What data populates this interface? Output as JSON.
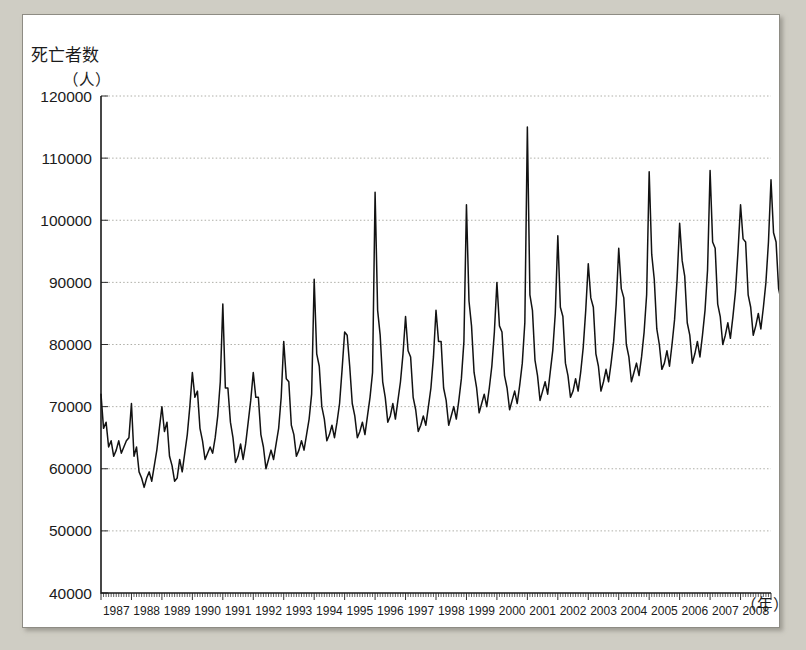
{
  "figure": {
    "y_axis_title": "死亡者数",
    "y_axis_unit": "（人）",
    "x_axis_unit": "（年）"
  },
  "chart_data": {
    "type": "line",
    "title": "",
    "subtitle": "",
    "xlabel": "（年）",
    "ylabel": "死亡者数（人）",
    "ylim": [
      40000,
      120000
    ],
    "xlim": [
      1987,
      2009
    ],
    "grid": true,
    "legend": null,
    "y_ticks": [
      40000,
      50000,
      60000,
      70000,
      80000,
      90000,
      100000,
      110000,
      120000
    ],
    "y_tick_labels": [
      "40000",
      "50000",
      "60000",
      "70000",
      "80000",
      "90000",
      "100000",
      "110000",
      "120000"
    ],
    "x_ticks": [
      1987,
      1988,
      1989,
      1990,
      1991,
      1992,
      1993,
      1994,
      1995,
      1996,
      1997,
      1998,
      1999,
      2000,
      2001,
      2002,
      2003,
      2004,
      2005,
      2006,
      2007,
      2008
    ],
    "x_tick_labels": [
      "1987",
      "1988",
      "1989",
      "1990",
      "1991",
      "1992",
      "1993",
      "1994",
      "1995",
      "1996",
      "1997",
      "1998",
      "1999",
      "2000",
      "2001",
      "2002",
      "2003",
      "2004",
      "2005",
      "2006",
      "2007",
      "2008"
    ],
    "x_minor_tick_interval_months": 1,
    "series": [
      {
        "name": "monthly deaths",
        "x_start": "1987-01",
        "x_step": "1 month",
        "values": [
          72000,
          66500,
          67500,
          63500,
          64500,
          62000,
          63000,
          64500,
          62500,
          63500,
          64500,
          65000,
          70500,
          62000,
          63500,
          59500,
          58500,
          57000,
          58500,
          59500,
          58000,
          60500,
          63000,
          66500,
          70000,
          66000,
          67500,
          62000,
          60500,
          58000,
          58500,
          61500,
          59500,
          62500,
          65500,
          70000,
          75500,
          71500,
          72500,
          66500,
          64500,
          61500,
          62500,
          63500,
          62500,
          65000,
          68500,
          74000,
          86500,
          73000,
          73000,
          67500,
          65000,
          61000,
          62000,
          64000,
          61500,
          64000,
          67500,
          71000,
          75500,
          71500,
          71500,
          65500,
          63500,
          60000,
          61500,
          63000,
          61500,
          64000,
          66500,
          71500,
          80500,
          74500,
          74000,
          67000,
          65500,
          62000,
          63000,
          64500,
          63000,
          65500,
          68000,
          72000,
          90500,
          78500,
          76500,
          70000,
          68000,
          64500,
          65500,
          67000,
          65000,
          67500,
          70500,
          76000,
          82000,
          81500,
          76500,
          70500,
          68500,
          65000,
          66000,
          67500,
          65500,
          68500,
          71500,
          75500,
          104500,
          85500,
          81500,
          74000,
          71500,
          67500,
          68500,
          70500,
          68000,
          71000,
          74000,
          78500,
          84500,
          79000,
          78000,
          71500,
          69500,
          66000,
          67000,
          68500,
          67000,
          70000,
          73000,
          78000,
          85500,
          80500,
          80500,
          73000,
          71000,
          67000,
          68500,
          70000,
          68000,
          71000,
          74500,
          80500,
          102500,
          87000,
          83000,
          75500,
          73000,
          69000,
          70500,
          72000,
          70000,
          73000,
          76500,
          82000,
          90000,
          83000,
          82000,
          75000,
          73000,
          69500,
          71000,
          72500,
          70500,
          73500,
          77000,
          83500,
          115000,
          88000,
          85500,
          77500,
          75000,
          71000,
          72500,
          74000,
          72000,
          75500,
          79000,
          85000,
          97500,
          86000,
          84500,
          77000,
          75000,
          71500,
          72500,
          74500,
          72500,
          75500,
          79500,
          85500,
          93000,
          87500,
          86000,
          78500,
          76500,
          72500,
          74000,
          76000,
          74000,
          77000,
          80500,
          86500,
          95500,
          89000,
          87500,
          80000,
          78000,
          74000,
          75500,
          77000,
          75000,
          78000,
          82000,
          88000,
          107800,
          94500,
          90500,
          82500,
          80000,
          76000,
          77000,
          79000,
          76500,
          80000,
          84000,
          90500,
          99500,
          93500,
          91000,
          83500,
          81500,
          77000,
          78500,
          80500,
          78000,
          81500,
          85500,
          92000,
          108000,
          96500,
          95500,
          86500,
          84500,
          80000,
          81500,
          83500,
          81000,
          84500,
          88500,
          95000,
          102500,
          97000,
          96500,
          88000,
          86000,
          81500,
          83000,
          85000,
          82500,
          86000,
          90000,
          96500,
          106500,
          98000,
          96500,
          89000,
          87000,
          82500,
          84000,
          86000,
          83500,
          87000,
          91000,
          98500,
          111500,
          103000,
          102000,
          92000,
          90000,
          85500
        ]
      }
    ]
  }
}
